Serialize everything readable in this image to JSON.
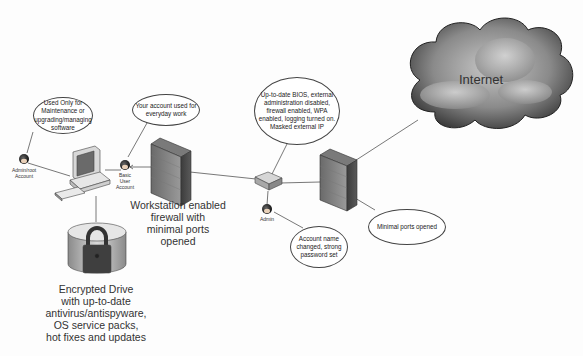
{
  "diagram": {
    "nodes": {
      "admin_root_account": {
        "label_line1": "Admin/root",
        "label_line2": "Account"
      },
      "basic_user_account": {
        "label_line1": "Basic",
        "label_line2": "User",
        "label_line3": "Account"
      },
      "router_admin": {
        "label": "Admin"
      },
      "workstation_firewall": {
        "line1": "Workstation enabled",
        "line2": "firewall with",
        "line3": "minimal ports",
        "line4": "opened"
      },
      "encrypted_drive": {
        "line1": "Encrypted Drive",
        "line2": "with up-to-date",
        "line3": "antivirus/antispyware,",
        "line4": "OS service packs,",
        "line5": "hot fixes and updates"
      },
      "internet": {
        "label": "Internet"
      }
    },
    "callouts": {
      "admin_usage": {
        "line1": "Used Only for",
        "line2": "Maintenance or",
        "line3": "upgrading/managing",
        "line4": "software"
      },
      "user_usage": {
        "line1": "Your account used for",
        "line2": "everyday work"
      },
      "router_config": {
        "line1": "Up-to-date BIOS, external",
        "line2": "administration disabled,",
        "line3": "firewall enabled, WPA",
        "line4": "enabled, logging turned on.",
        "line5": "Masked external IP"
      },
      "admin_account": {
        "line1": "Account name",
        "line2": "changed, strong",
        "line3": "password set"
      },
      "network_firewall": {
        "line1": "Minimal ports opened"
      }
    },
    "colors": {
      "line": "#555555",
      "firewall_dark": "#4a4a4a",
      "firewall_light": "#9a9a9a",
      "cloud_dark": "#3a3a3a",
      "cloud_light": "#b8b8b8"
    }
  }
}
